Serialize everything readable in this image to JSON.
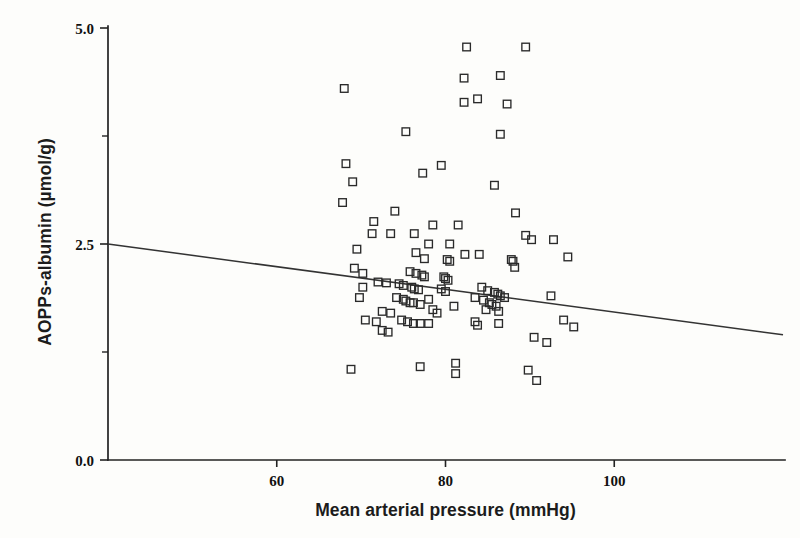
{
  "chart_data": {
    "type": "scatter",
    "title": "",
    "xlabel": "Mean arterial pressure (mmHg)",
    "ylabel": "AOPPs-albumin (µmol/g)",
    "xlim": [
      40,
      120
    ],
    "ylim": [
      0.0,
      5.0
    ],
    "xticks": [
      60,
      80,
      100
    ],
    "xtick_labels": [
      "60",
      "80",
      "100"
    ],
    "yticks": [
      0.0,
      2.5,
      5.0
    ],
    "ytick_labels": [
      "0.0",
      "2.5",
      "5.0"
    ],
    "y_minor_ticks": [
      1.25,
      3.75
    ],
    "grid": false,
    "legend": "none",
    "marker": "open-square",
    "n_points": 108,
    "trendline": {
      "type": "linear-regression",
      "x_start": 40,
      "y_start": 2.5,
      "x_end": 120,
      "y_end": 1.45,
      "slope": -0.0131,
      "intercept": 3.025,
      "direction": "negative"
    },
    "points": [
      [
        68.0,
        4.3
      ],
      [
        89.5,
        4.78
      ],
      [
        82.5,
        4.78
      ],
      [
        86.5,
        4.45
      ],
      [
        82.2,
        4.42
      ],
      [
        83.8,
        4.18
      ],
      [
        82.2,
        4.14
      ],
      [
        87.3,
        4.12
      ],
      [
        75.3,
        3.8
      ],
      [
        86.5,
        3.77
      ],
      [
        68.2,
        3.43
      ],
      [
        79.5,
        3.41
      ],
      [
        77.3,
        3.32
      ],
      [
        69.0,
        3.22
      ],
      [
        85.8,
        3.18
      ],
      [
        67.8,
        2.98
      ],
      [
        74.0,
        2.88
      ],
      [
        88.3,
        2.86
      ],
      [
        71.5,
        2.76
      ],
      [
        78.5,
        2.72
      ],
      [
        81.5,
        2.72
      ],
      [
        71.3,
        2.62
      ],
      [
        73.5,
        2.62
      ],
      [
        76.3,
        2.62
      ],
      [
        89.5,
        2.6
      ],
      [
        92.8,
        2.55
      ],
      [
        90.2,
        2.55
      ],
      [
        80.5,
        2.5
      ],
      [
        78.0,
        2.5
      ],
      [
        69.5,
        2.44
      ],
      [
        76.5,
        2.4
      ],
      [
        82.3,
        2.38
      ],
      [
        84.0,
        2.38
      ],
      [
        94.5,
        2.35
      ],
      [
        77.5,
        2.33
      ],
      [
        80.2,
        2.32
      ],
      [
        80.5,
        2.3
      ],
      [
        87.8,
        2.32
      ],
      [
        69.2,
        2.22
      ],
      [
        70.2,
        2.16
      ],
      [
        88.0,
        2.3
      ],
      [
        88.2,
        2.23
      ],
      [
        75.8,
        2.18
      ],
      [
        76.5,
        2.16
      ],
      [
        77.2,
        2.14
      ],
      [
        77.5,
        2.12
      ],
      [
        79.8,
        2.12
      ],
      [
        80.0,
        2.1
      ],
      [
        80.3,
        2.08
      ],
      [
        72.0,
        2.06
      ],
      [
        73.0,
        2.05
      ],
      [
        74.5,
        2.04
      ],
      [
        75.0,
        2.02
      ],
      [
        70.2,
        2.0
      ],
      [
        76.0,
        2.0
      ],
      [
        76.3,
        1.98
      ],
      [
        76.8,
        1.97
      ],
      [
        79.5,
        1.98
      ],
      [
        80.0,
        1.95
      ],
      [
        84.3,
        2.0
      ],
      [
        85.0,
        1.96
      ],
      [
        85.8,
        1.94
      ],
      [
        86.2,
        1.92
      ],
      [
        86.5,
        1.9
      ],
      [
        87.0,
        1.88
      ],
      [
        92.5,
        1.9
      ],
      [
        69.8,
        1.88
      ],
      [
        74.2,
        1.88
      ],
      [
        75.0,
        1.86
      ],
      [
        75.3,
        1.84
      ],
      [
        75.8,
        1.82
      ],
      [
        76.2,
        1.82
      ],
      [
        77.0,
        1.8
      ],
      [
        78.0,
        1.86
      ],
      [
        83.5,
        1.88
      ],
      [
        84.5,
        1.85
      ],
      [
        85.2,
        1.82
      ],
      [
        85.5,
        1.8
      ],
      [
        86.0,
        1.78
      ],
      [
        81.0,
        1.78
      ],
      [
        72.5,
        1.72
      ],
      [
        73.5,
        1.7
      ],
      [
        78.5,
        1.74
      ],
      [
        79.0,
        1.7
      ],
      [
        84.8,
        1.74
      ],
      [
        86.3,
        1.72
      ],
      [
        70.5,
        1.62
      ],
      [
        71.8,
        1.6
      ],
      [
        74.8,
        1.62
      ],
      [
        75.5,
        1.6
      ],
      [
        76.2,
        1.58
      ],
      [
        77.0,
        1.58
      ],
      [
        78.0,
        1.58
      ],
      [
        83.5,
        1.6
      ],
      [
        83.8,
        1.56
      ],
      [
        86.3,
        1.58
      ],
      [
        94.0,
        1.62
      ],
      [
        95.2,
        1.54
      ],
      [
        72.5,
        1.5
      ],
      [
        73.2,
        1.48
      ],
      [
        90.5,
        1.42
      ],
      [
        92.0,
        1.36
      ],
      [
        68.8,
        1.05
      ],
      [
        77.0,
        1.08
      ],
      [
        81.2,
        1.12
      ],
      [
        81.2,
        1.0
      ],
      [
        89.8,
        1.04
      ],
      [
        90.8,
        0.92
      ]
    ]
  }
}
